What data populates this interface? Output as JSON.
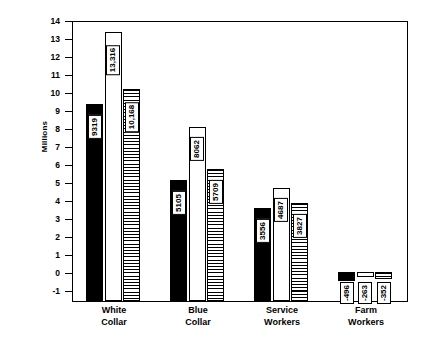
{
  "chart_data": {
    "type": "bar",
    "title": "",
    "subtitle": "",
    "xlabel": "",
    "ylabel": "Millions",
    "ylim": [
      -1.6,
      14
    ],
    "yticks": [
      14,
      13,
      12,
      11,
      10,
      9,
      8,
      7,
      6,
      5,
      4,
      3,
      2,
      1,
      0,
      -1
    ],
    "ytick_labels": [
      "14",
      "13",
      "12",
      "11",
      "10",
      "9",
      "8",
      "7",
      "6",
      "5",
      "4",
      "3",
      "2",
      "1",
      "0",
      "-1"
    ],
    "grid": false,
    "legend_position": "none",
    "units_note": "bar value labels are in thousands; axis is in millions",
    "categories": [
      "White Collar",
      "Blue Collar",
      "Service Workers",
      "Farm Workers"
    ],
    "series": [
      {
        "name": "series-solid",
        "fill": "solid-black",
        "values": [
          9319,
          5105,
          3556,
          -496
        ],
        "labels": [
          "9319",
          "5105",
          "3556",
          "-496"
        ]
      },
      {
        "name": "series-open",
        "fill": "white-outline",
        "values": [
          13316,
          8062,
          4687,
          -263
        ],
        "labels": [
          "13,316",
          "8062",
          "4687",
          "-263"
        ]
      },
      {
        "name": "series-hatched",
        "fill": "horizontal-hatch",
        "values": [
          10168,
          5709,
          3827,
          -352
        ],
        "labels": [
          "10,168",
          "5709",
          "3827",
          "-352"
        ]
      }
    ],
    "colors": {
      "solid": "#000000",
      "open": "#ffffff",
      "hatch_line": "#000000",
      "axis": "#000000",
      "background": "#ffffff"
    }
  }
}
